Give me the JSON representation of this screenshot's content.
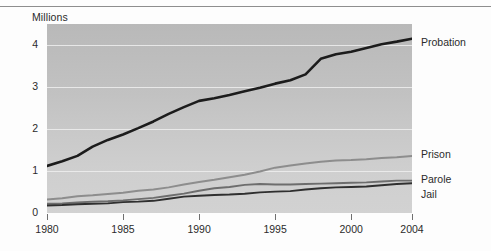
{
  "chart_data": {
    "type": "line",
    "title": "",
    "subtitle": "",
    "unit_label": "Millions",
    "xlabel": "",
    "ylabel": "Millions",
    "xlim": [
      1980,
      2004
    ],
    "ylim": [
      0,
      4.5
    ],
    "grid": true,
    "legend_position": "right-of-plot (series end labels)",
    "y_ticks": [
      "0",
      "1",
      "2",
      "3",
      "4"
    ],
    "y_tick_values": [
      0,
      1,
      2,
      3,
      4
    ],
    "x_ticks": [
      "1980",
      "1985",
      "1990",
      "1995",
      "2000",
      "2004"
    ],
    "x_tick_values": [
      1980,
      1985,
      1990,
      1995,
      2000,
      2004
    ],
    "x": [
      1980,
      1981,
      1982,
      1983,
      1984,
      1985,
      1986,
      1987,
      1988,
      1989,
      1990,
      1991,
      1992,
      1993,
      1994,
      1995,
      1996,
      1997,
      1998,
      1999,
      2000,
      2001,
      2002,
      2003,
      2004
    ],
    "series": [
      {
        "name": "Probation",
        "color": "#1c1c1c",
        "width": 2.6,
        "values": [
          1.12,
          1.23,
          1.36,
          1.58,
          1.74,
          1.87,
          2.02,
          2.18,
          2.36,
          2.52,
          2.67,
          2.73,
          2.81,
          2.9,
          2.98,
          3.08,
          3.16,
          3.3,
          3.67,
          3.78,
          3.84,
          3.93,
          4.02,
          4.08,
          4.15
        ]
      },
      {
        "name": "Prison",
        "color": "#8d8d8d",
        "width": 2.0,
        "values": [
          0.32,
          0.35,
          0.4,
          0.42,
          0.45,
          0.48,
          0.53,
          0.56,
          0.61,
          0.68,
          0.74,
          0.79,
          0.85,
          0.91,
          0.99,
          1.08,
          1.13,
          1.18,
          1.22,
          1.25,
          1.26,
          1.28,
          1.31,
          1.33,
          1.36
        ]
      },
      {
        "name": "Parole",
        "color": "#6d6d6d",
        "width": 1.9,
        "values": [
          0.22,
          0.23,
          0.25,
          0.27,
          0.28,
          0.3,
          0.33,
          0.36,
          0.41,
          0.46,
          0.53,
          0.59,
          0.62,
          0.67,
          0.69,
          0.68,
          0.68,
          0.69,
          0.7,
          0.71,
          0.72,
          0.73,
          0.75,
          0.77,
          0.77
        ]
      },
      {
        "name": "Jail",
        "color": "#2f2f2f",
        "width": 1.9,
        "values": [
          0.18,
          0.19,
          0.21,
          0.22,
          0.23,
          0.26,
          0.27,
          0.29,
          0.34,
          0.39,
          0.41,
          0.43,
          0.44,
          0.46,
          0.49,
          0.51,
          0.52,
          0.56,
          0.59,
          0.61,
          0.62,
          0.63,
          0.66,
          0.69,
          0.71
        ]
      }
    ],
    "series_labels": [
      {
        "name": "Probation",
        "y_px": 36
      },
      {
        "name": "Prison",
        "y_px": 148
      },
      {
        "name": "Parole",
        "y_px": 173
      },
      {
        "name": "Jail",
        "y_px": 188
      }
    ]
  }
}
